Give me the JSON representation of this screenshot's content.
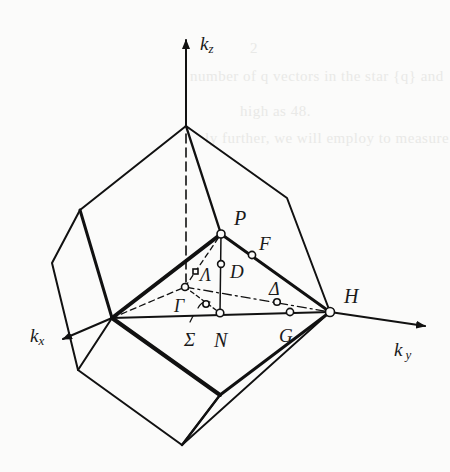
{
  "figure": {
    "background_color": "#fbfbfa",
    "line_color": "#111111",
    "bleed_through_text": [
      "2",
      "number of q vectors in the star {q} and",
      "high as 48.",
      "ly further, we will employ to measure"
    ],
    "axes": {
      "kz": {
        "label": "k",
        "sub": "z"
      },
      "kx": {
        "label": "k",
        "sub": "x"
      },
      "ky": {
        "label": "k",
        "sub": "y"
      }
    },
    "points": {
      "P": "P",
      "F": "F",
      "D": "D",
      "Lambda": "Λ",
      "Gamma": "Γ",
      "Delta": "Δ",
      "Sigma": "Σ",
      "N": "N",
      "G": "G",
      "H": "H"
    }
  }
}
